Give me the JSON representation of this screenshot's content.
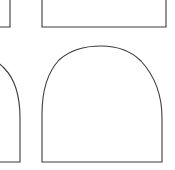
{
  "canvas": {
    "width": 175,
    "height": 170,
    "background_color": "#ffffff",
    "stroke_color": "#3b3b3b",
    "fill_color": "#ffffff",
    "stroke_width": 1.1,
    "description": "Grid of outlined arch (dome) shapes, cropped at the edges"
  },
  "shapes": [
    {
      "id": "shape-top-left-partial",
      "name": "arch-outline-top-left-cropped",
      "row": 1,
      "column": 1,
      "cropped": true,
      "crop_edges": "left, top",
      "path": "M -40 -30 L -40 27 L 10 27 L 10 -30"
    },
    {
      "id": "shape-top-center-partial",
      "name": "arch-outline-top-center-cropped",
      "row": 1,
      "column": 2,
      "cropped": true,
      "crop_edges": "top",
      "path": "M 42 -30 L 42 27 L 166 27 L 166 -30"
    },
    {
      "id": "shape-mid-left-partial",
      "name": "arch-outline-mid-left-cropped",
      "row": 2,
      "column": 1,
      "cropped": true,
      "crop_edges": "left",
      "path": "M -62 162 L 20 162 L 20 118 C 20 96 14 78 4 68 C -6 58 -18 53 -30 53"
    },
    {
      "id": "shape-mid-center",
      "name": "arch-outline-mid-center",
      "row": 2,
      "column": 2,
      "cropped": false,
      "crop_edges": "none",
      "path": "M 42 162 L 42 114 C 42 90 48 72 59 60 C 70 50 85 46 101 46 C 117 46 131 51 141 61 C 152 73 162 92 162 118 L 162 162 Z"
    }
  ]
}
